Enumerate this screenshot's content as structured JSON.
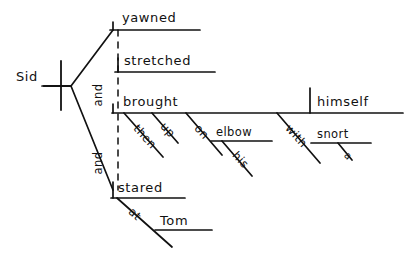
{
  "diagram": {
    "type": "reed-kellogg-sentence-diagram",
    "sentence": "Sid yawned and stretched and brought then up on his elbow with a snort and stared at Tom",
    "ink_color": "#111111",
    "background_color": "#ffffff",
    "subject": {
      "word": "Sid"
    },
    "conjunctions": [
      {
        "word": "and"
      },
      {
        "word": "and"
      }
    ],
    "predicates": [
      {
        "word": "yawned"
      },
      {
        "word": "stretched"
      },
      {
        "word": "brought"
      },
      {
        "word": "stared"
      }
    ],
    "direct_object": {
      "word": "himself"
    },
    "modifiers": [
      {
        "word": "then"
      },
      {
        "word": "up"
      },
      {
        "word": "his"
      },
      {
        "word": "a"
      }
    ],
    "prepositions": [
      {
        "word": "on",
        "object": "elbow"
      },
      {
        "word": "with",
        "object": "snort"
      },
      {
        "word": "at",
        "object": "Tom"
      }
    ],
    "prep_objects": [
      {
        "word": "elbow"
      },
      {
        "word": "snort"
      },
      {
        "word": "Tom"
      }
    ],
    "labels": {
      "sid": "Sid",
      "yawned": "yawned",
      "stretched": "stretched",
      "brought": "brought",
      "stared": "stared",
      "himself": "himself",
      "and_upper": "and",
      "and_lower": "and",
      "then": "then",
      "up": "up",
      "on": "on",
      "elbow": "elbow",
      "his": "his",
      "with": "with",
      "snort": "snort",
      "a": "a",
      "at": "at",
      "tom": "Tom"
    }
  }
}
